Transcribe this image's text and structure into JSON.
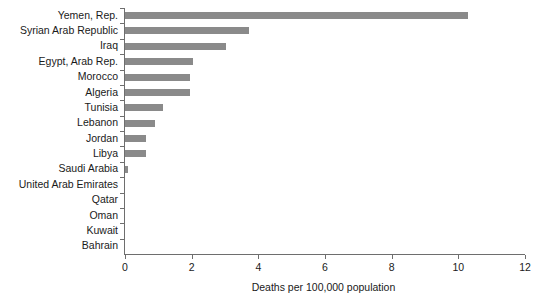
{
  "chart_data": {
    "type": "bar",
    "orientation": "horizontal",
    "title": "",
    "xlabel": "Deaths per 100,000 population",
    "ylabel": "",
    "xlim": [
      0,
      12
    ],
    "xticks": [
      0,
      2,
      4,
      6,
      8,
      10,
      12
    ],
    "xtick_labels": [
      "0",
      "2",
      "4",
      "6",
      "8",
      "10",
      "12"
    ],
    "grid": false,
    "legend": false,
    "bar_color": "#8a8a8a",
    "axis_color": "#6e6e6e",
    "background_color": "#ffffff",
    "categories": [
      "Yemen, Rep.",
      "Syrian Arab Republic",
      "Iraq",
      "Egypt, Arab Rep.",
      "Morocco",
      "Algeria",
      "Tunisia",
      "Lebanon",
      "Jordan",
      "Libya",
      "Saudi Arabia",
      "United Arab Emirates",
      "Qatar",
      "Oman",
      "Kuwait",
      "Bahrain"
    ],
    "values": [
      10.3,
      3.72,
      3.02,
      2.05,
      1.95,
      1.95,
      1.15,
      0.9,
      0.63,
      0.63,
      0.1,
      0.0,
      0.0,
      0.0,
      0.0,
      0.0
    ]
  }
}
